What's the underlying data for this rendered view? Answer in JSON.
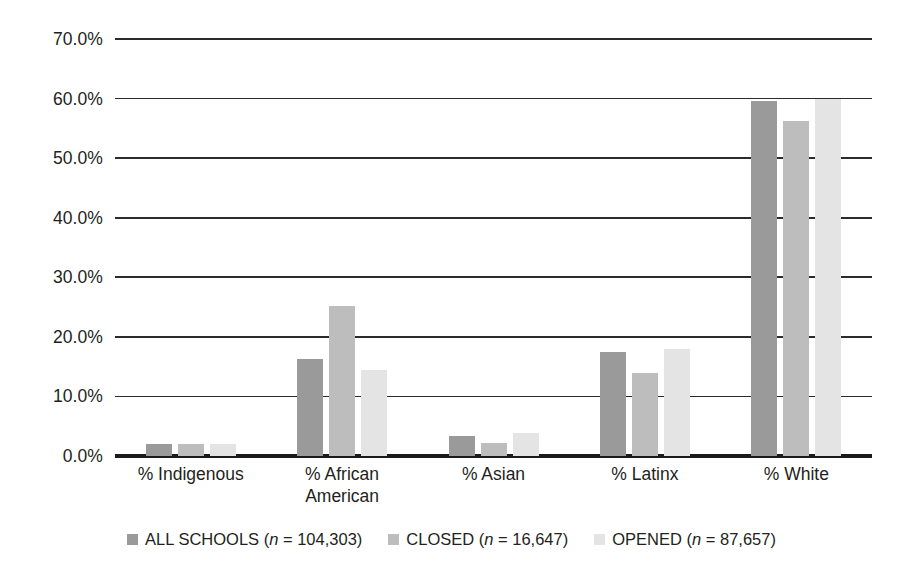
{
  "chart_data": {
    "type": "bar",
    "title": "",
    "subtitle": "",
    "xlabel": "",
    "ylabel": "",
    "ylim": [
      0,
      70
    ],
    "ytick_labels": [
      "0.0%",
      "10.0%",
      "20.0%",
      "30.0%",
      "40.0%",
      "50.0%",
      "60.0%",
      "70.0%"
    ],
    "ytick_values": [
      0,
      10,
      20,
      30,
      40,
      50,
      60,
      70
    ],
    "grid": true,
    "legend_position": "bottom",
    "categories": [
      "% Indigenous",
      "% African American",
      "% Asian",
      "% Latinx",
      "% White"
    ],
    "series": [
      {
        "name": "ALL SCHOOLS",
        "n": "104,303",
        "legend_label": "ALL SCHOOLS (n = 104,303)",
        "color": "#9a9a9a",
        "values": [
          2.1,
          16.3,
          3.3,
          17.4,
          59.6
        ]
      },
      {
        "name": "CLOSED",
        "n": "16,647",
        "legend_label": "CLOSED (n = 16,647)",
        "color": "#bdbdbd",
        "values": [
          2.0,
          25.1,
          2.2,
          14.0,
          56.2
        ]
      },
      {
        "name": "OPENED",
        "n": "87,657",
        "legend_label": "OPENED (n = 87,657)",
        "color": "#e4e4e4",
        "values": [
          2.0,
          14.5,
          3.8,
          18.0,
          59.9
        ]
      }
    ]
  },
  "legend": {
    "items": [
      {
        "label_prefix": "ALL SCHOOLS (",
        "italic": "n",
        "label_suffix": " = 104,303)",
        "color": "#9a9a9a"
      },
      {
        "label_prefix": "CLOSED (",
        "italic": "n",
        "label_suffix": " = 16,647)",
        "color": "#bdbdbd"
      },
      {
        "label_prefix": "OPENED (",
        "italic": "n",
        "label_suffix": " = 87,657)",
        "color": "#e4e4e4"
      }
    ]
  },
  "axis": {
    "gridline_color": "#2b2b2b",
    "baseline_color": "#1b1b1b"
  }
}
